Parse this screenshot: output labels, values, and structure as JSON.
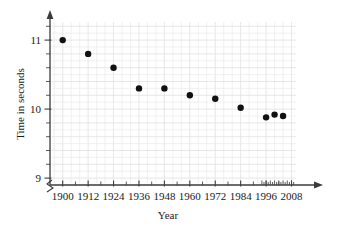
{
  "chart_data": {
    "type": "scatter",
    "title": "",
    "xlabel": "Year",
    "ylabel": "Time in seconds",
    "xlim": [
      1894,
      2012
    ],
    "ylim": [
      8.9,
      11.32
    ],
    "grid": true,
    "legend": null,
    "x_tick_labels": [
      "1900",
      "1912",
      "1924",
      "1936",
      "1948",
      "1960",
      "1972",
      "1984",
      "1996",
      "2008"
    ],
    "x_tick_values": [
      1900,
      1912,
      1924,
      1936,
      1948,
      1960,
      1972,
      1984,
      1996,
      2008
    ],
    "y_tick_labels": [
      "9",
      "10",
      "11"
    ],
    "y_tick_values": [
      9,
      10,
      11
    ],
    "y_minor_step": 0.2,
    "points": [
      {
        "x": 1900,
        "y": 11.0
      },
      {
        "x": 1912,
        "y": 10.8
      },
      {
        "x": 1924,
        "y": 10.6
      },
      {
        "x": 1936,
        "y": 10.3
      },
      {
        "x": 1948,
        "y": 10.3
      },
      {
        "x": 1960,
        "y": 10.2
      },
      {
        "x": 1972,
        "y": 10.15
      },
      {
        "x": 1984,
        "y": 10.02
      },
      {
        "x": 1996,
        "y": 9.88
      },
      {
        "x": 2000,
        "y": 9.92
      },
      {
        "x": 2004,
        "y": 9.9
      }
    ],
    "series": [
      {
        "name": "Winning time",
        "x": [
          1900,
          1912,
          1924,
          1936,
          1948,
          1960,
          1972,
          1984,
          1996,
          2000,
          2004
        ],
        "values": [
          11.0,
          10.8,
          10.6,
          10.3,
          10.3,
          10.2,
          10.15,
          10.02,
          9.88,
          9.92,
          9.9
        ]
      }
    ],
    "marker": {
      "shape": "circle",
      "color": "#111111",
      "size": 3.2
    },
    "axis_break_y": true,
    "axis_arrows": {
      "x": "right",
      "y": "up"
    }
  },
  "colors": {
    "axis": "#3c3a3a",
    "grid_minor": "#eceaea",
    "grid_major": "#e2e0e0",
    "marker": "#111111",
    "text": "#1a1a1a",
    "background": "#ffffff"
  }
}
